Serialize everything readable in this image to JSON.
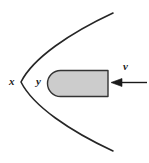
{
  "figure": {
    "width": 149,
    "height": 163,
    "background_color": "#ffffff",
    "labels": [
      {
        "id": "x",
        "text": "x",
        "role": "parabola-axis-label",
        "x": 9,
        "y": 76,
        "style": "italic-bold"
      },
      {
        "id": "y",
        "text": "y",
        "role": "object-label",
        "x": 36,
        "y": 76,
        "style": "italic-bold"
      },
      {
        "id": "v",
        "text": "v",
        "role": "velocity-label",
        "x": 123,
        "y": 61,
        "style": "italic-bold"
      }
    ],
    "shapes": {
      "parabola": {
        "name": "parabola-curve",
        "stroke_color": "#262626",
        "stroke_width": 1.6,
        "fill": "none",
        "vertex": {
          "x": 21,
          "y": 82
        },
        "upper_end": {
          "x": 113,
          "y": 13
        },
        "lower_end": {
          "x": 113,
          "y": 151
        },
        "opens": "right"
      },
      "block": {
        "name": "rounded-block",
        "fill_color": "#cccccc",
        "stroke_color": "#333333",
        "stroke_width": 1.4,
        "x": 47,
        "y": 70,
        "width": 61,
        "height": 27,
        "left_cap": "rounded",
        "right_cap": "square",
        "corner_radius": 13.5
      },
      "arrow": {
        "name": "velocity-arrow",
        "stroke_color": "#1a1a1a",
        "stroke_width": 1.5,
        "direction": "left",
        "tip": {
          "x": 111,
          "y": 82
        },
        "tail": {
          "x": 147,
          "y": 82
        },
        "head_length": 11,
        "head_width": 8
      }
    }
  }
}
